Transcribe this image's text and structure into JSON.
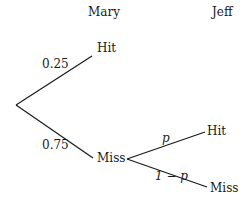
{
  "headers": {
    "first_player": "Mary",
    "second_player": "Jeff"
  },
  "tree": {
    "mary_hit": {
      "label": "Hit",
      "probability": "0.25"
    },
    "mary_miss": {
      "label": "Miss",
      "probability": "0.75"
    },
    "jeff_hit": {
      "label": "Hit",
      "probability": "p"
    },
    "jeff_miss": {
      "label": "Miss",
      "probability": "1 − p"
    }
  },
  "colors": {
    "line": "#1a1a1a",
    "text": "#1a1a1a",
    "background": "#ffffff"
  }
}
